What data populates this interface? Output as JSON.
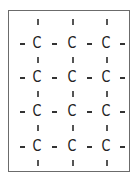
{
  "diagram": {
    "type": "chemical-structure",
    "atom_symbol": "C",
    "rows": 4,
    "columns": 3,
    "atoms": [
      [
        "C",
        "C",
        "C"
      ],
      [
        "C",
        "C",
        "C"
      ],
      [
        "C",
        "C",
        "C"
      ],
      [
        "C",
        "C",
        "C"
      ]
    ],
    "bond_symbol_horizontal": "-",
    "bond_symbol_vertical": "|",
    "colors": {
      "ink": "#222222",
      "frame": "#6b6b6b",
      "background": "#ffffff"
    }
  }
}
